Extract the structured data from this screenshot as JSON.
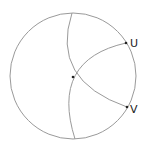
{
  "diagram": {
    "type": "hyperbolic-disk-geodesics",
    "stroke_color": "#9a9a9a",
    "point_color": "#222222",
    "label_color": "#222222",
    "circle": {
      "cx": 73,
      "cy": 76,
      "r": 63
    },
    "center_point": {
      "x": 73,
      "y": 77
    },
    "points": [
      {
        "name": "U",
        "x": 126,
        "y": 43,
        "label": "U"
      },
      {
        "name": "V",
        "x": 127,
        "y": 107,
        "label": "V"
      }
    ],
    "arcs": [
      {
        "name": "top-to-V",
        "from": [
          72,
          12
        ],
        "to": [
          127,
          107
        ]
      },
      {
        "name": "U-to-bottom",
        "from": [
          126,
          43
        ],
        "to": [
          75,
          140
        ]
      },
      {
        "name": "center-to-U",
        "from": [
          73,
          77
        ],
        "to": [
          126,
          43
        ]
      }
    ]
  }
}
